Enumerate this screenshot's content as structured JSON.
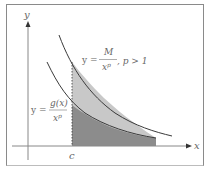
{
  "axes": {
    "x_label": "x",
    "y_label": "y",
    "c_label": "c"
  },
  "upper_curve": {
    "prefix": "y =",
    "numerator": "M",
    "denominator_base": "x",
    "denominator_exp": "p",
    "condition": ", p > 1"
  },
  "lower_curve": {
    "prefix": "y =",
    "numerator": "g(x)",
    "denominator_base": "x",
    "denominator_exp": "p"
  },
  "colors": {
    "upper_region": "#c8c8c8",
    "lower_region": "#8c8c8c",
    "curve": "#3a3a3a",
    "axis": "#888888"
  }
}
